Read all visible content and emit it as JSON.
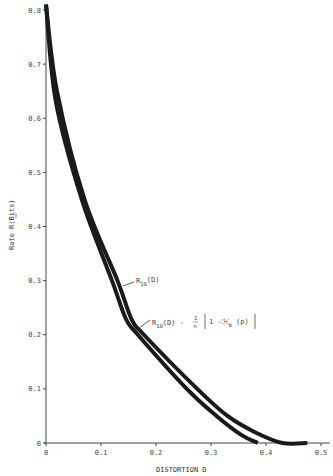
{
  "chart_data": {
    "type": "line",
    "title": "",
    "xlabel": "DISTORTION D",
    "ylabel": "Rate R(Bits)",
    "xlim": [
      0,
      0.5
    ],
    "ylim": [
      0,
      0.8
    ],
    "grid": false,
    "x_ticks": [
      "0",
      "0.1",
      "0.2",
      "0.3",
      "0.4",
      "0.5"
    ],
    "y_ticks": [
      "0",
      "0.1",
      "0.2",
      "0.3",
      "0.4",
      "0.5",
      "0.6",
      "0.7",
      "0.8"
    ],
    "series": [
      {
        "name": "R10(D)",
        "label_main": "R",
        "label_sub": "10",
        "label_rest": "(D)",
        "points": [
          [
            0,
            0.81
          ],
          [
            0.02,
            0.65
          ],
          [
            0.07,
            0.45
          ],
          [
            0.13,
            0.3
          ],
          [
            0.155,
            0.23
          ],
          [
            0.178,
            0.2
          ],
          [
            0.275,
            0.1
          ],
          [
            0.33,
            0.05
          ],
          [
            0.38,
            0.02
          ],
          [
            0.43,
            0.0
          ],
          [
            0.475,
            0.0
          ]
        ]
      },
      {
        "name": "R10(D) - 1/n [1 - ℋb(p)]",
        "label_main": "R",
        "label_sub": "10",
        "label_rest": "(D) - ",
        "label_frac_num": "1",
        "label_frac_den": "n",
        "label_bracket": "1 -ℋ",
        "label_bracket_sub": "b",
        "label_bracket_rest": "(p)",
        "points": [
          [
            0,
            0.81
          ],
          [
            0.018,
            0.63
          ],
          [
            0.065,
            0.45
          ],
          [
            0.12,
            0.3
          ],
          [
            0.145,
            0.23
          ],
          [
            0.167,
            0.2
          ],
          [
            0.256,
            0.1
          ],
          [
            0.31,
            0.05
          ],
          [
            0.355,
            0.015
          ],
          [
            0.385,
            0.0
          ]
        ]
      }
    ]
  }
}
